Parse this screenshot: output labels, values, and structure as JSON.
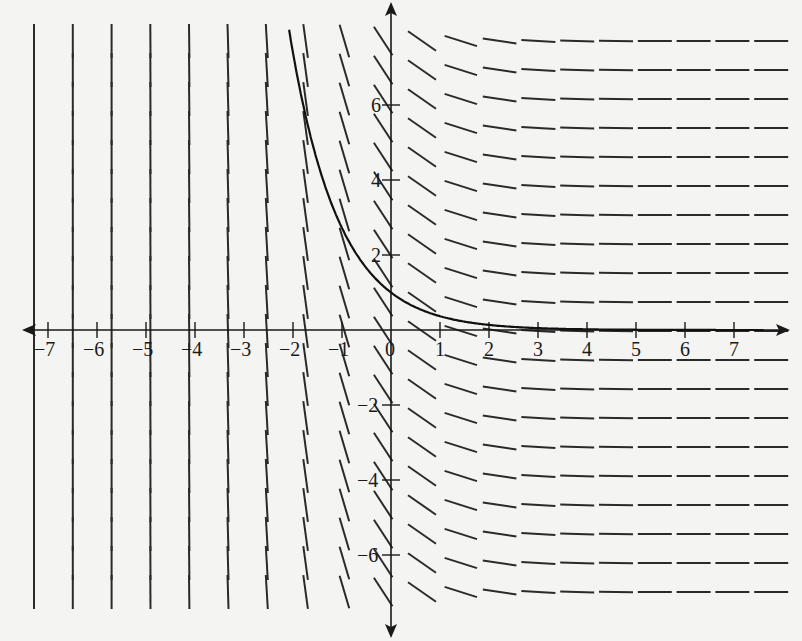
{
  "chart_data": {
    "type": "line",
    "title": "",
    "subtitle": "",
    "xlabel": "",
    "ylabel": "",
    "xlim": [
      -7.5,
      7.5
    ],
    "ylim": [
      -7.5,
      8
    ],
    "grid": false,
    "legend": null,
    "x_ticks": [
      -7,
      -6,
      -5,
      -4,
      -3,
      -2,
      -1,
      0,
      1,
      2,
      3,
      4,
      5,
      6,
      7
    ],
    "x_tick_labels": [
      "−7",
      "−6",
      "−5",
      "−4",
      "−3",
      "−2",
      "−1",
      "0",
      "1",
      "2",
      "3",
      "4",
      "5",
      "6",
      "7"
    ],
    "y_ticks": [
      -6,
      -4,
      -2,
      2,
      4,
      6
    ],
    "y_tick_labels": [
      "−6",
      "−4",
      "−2",
      "2",
      "4",
      "6"
    ],
    "slope_field": {
      "equation": "dy/dx = -e^(-x)",
      "x_samples": [
        -7.2,
        -6.4,
        -5.6,
        -4.8,
        -4.0,
        -3.2,
        -2.4,
        -1.6,
        -0.8,
        0.0,
        0.8,
        1.6,
        2.4,
        3.2,
        4.0,
        4.8,
        5.6,
        6.4,
        7.2,
        8.0
      ],
      "row_count": 20
    },
    "series": [
      {
        "name": "y = e^(-x)",
        "x": [
          -2.08,
          -2.0,
          -1.5,
          -1.0,
          -0.5,
          0.0,
          0.5,
          1.0,
          1.5,
          2.0,
          3.0,
          4.0,
          5.0,
          6.0,
          7.0,
          7.6
        ],
        "y": [
          8.0,
          7.39,
          4.48,
          2.72,
          1.65,
          1.0,
          0.61,
          0.37,
          0.22,
          0.14,
          0.05,
          0.02,
          0.01,
          0.0,
          0.0,
          0.0
        ]
      }
    ]
  }
}
